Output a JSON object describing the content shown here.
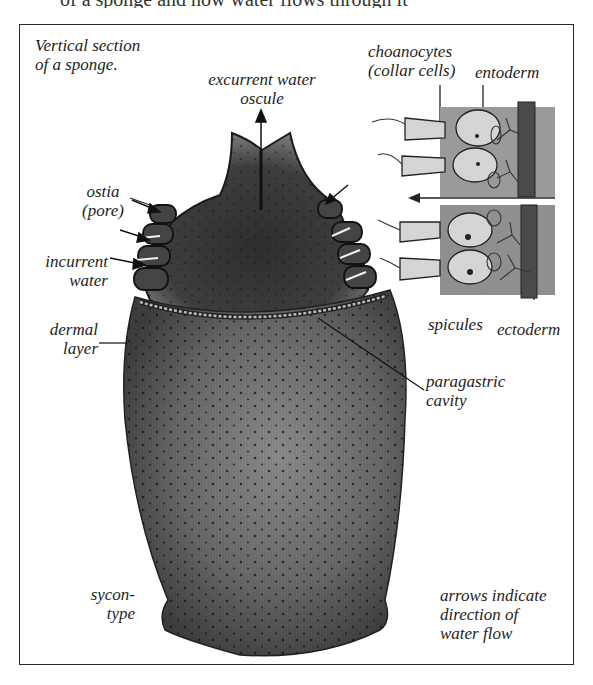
{
  "header_fragment": "of a sponge and how water flows through it",
  "diagram": {
    "title_line1": "Vertical section",
    "title_line2": "of a sponge.",
    "labels": {
      "excurrent_line1": "excurrent water",
      "excurrent_line2": "oscule",
      "ostia_line1": "ostia",
      "ostia_line2": "(pore)",
      "incurrent_line1": "incurrent",
      "incurrent_line2": "water",
      "dermal_line1": "dermal",
      "dermal_line2": "layer",
      "choanocytes_line1": "choanocytes",
      "choanocytes_line2": "(collar cells)",
      "entoderm": "entoderm",
      "spicules": "spicules",
      "ectoderm": "ectoderm",
      "paragastric_line1": "paragastric",
      "paragastric_line2": "cavity",
      "sycon_line1": "sycon-",
      "sycon_line2": "type",
      "note_line1": "arrows indicate",
      "note_line2": "direction of",
      "note_line3": "water flow"
    },
    "colors": {
      "body_dark": "#3a3a3a",
      "body_mid": "#6b6b6b",
      "body_light": "#8e8e8e",
      "tissue": "#9a9a9a",
      "ectoderm": "#4a4a4a",
      "cell": "#d4d4d4",
      "line": "#1e1e1e"
    }
  }
}
